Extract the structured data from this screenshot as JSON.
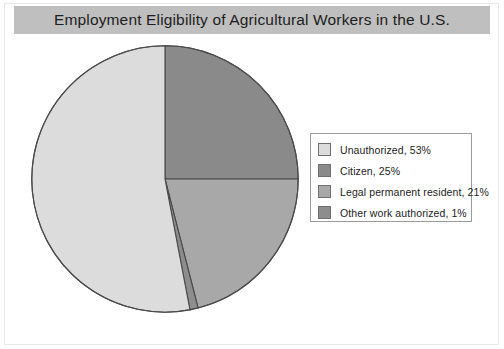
{
  "title": "Employment Eligibility of Agricultural Workers in the U.S.",
  "colors": {
    "title_bar": "#bfbfbf",
    "background": "#ffffff",
    "slice_outline": "#4a4a4a",
    "legend_border": "#9a9a9a",
    "text": "#1d1d1d"
  },
  "legend": {
    "items": [
      {
        "label": "Unauthorized, 53%",
        "color": "#dcdcdc"
      },
      {
        "label": "Citizen, 25%",
        "color": "#8a8a8a"
      },
      {
        "label": "Legal permanent resident, 21%",
        "color": "#a8a8a8"
      },
      {
        "label": "Other work authorized, 1%",
        "color": "#8d8d8d"
      }
    ]
  },
  "chart_data": {
    "type": "pie",
    "title": "Employment Eligibility of Agricultural Workers in the U.S.",
    "xlabel": "",
    "ylabel": "",
    "categories": [
      "Unauthorized",
      "Citizen",
      "Legal permanent resident",
      "Other work authorized"
    ],
    "values": [
      53,
      25,
      21,
      1
    ],
    "value_unit": "%",
    "data_labels": [
      "Unauthorized, 53%",
      "Citizen, 25%",
      "Legal permanent resident, 21%",
      "Other work authorized, 1%"
    ],
    "colors": [
      "#dcdcdc",
      "#8a8a8a",
      "#a8a8a8",
      "#8d8d8d"
    ],
    "start_angle_deg": 0,
    "direction": "clockwise",
    "draw_order": [
      "Citizen",
      "Legal permanent resident",
      "Other work authorized",
      "Unauthorized"
    ],
    "legend_position": "right",
    "grid": false
  }
}
